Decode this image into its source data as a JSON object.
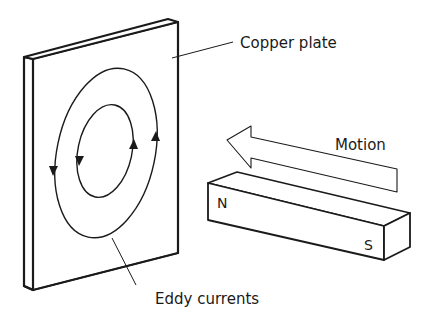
{
  "diagram": {
    "labels": {
      "copper_plate": "Copper plate",
      "eddy_currents": "Eddy currents",
      "motion": "Motion",
      "north": "N",
      "south": "S"
    },
    "colors": {
      "stroke": "#1a1a1a",
      "background": "#ffffff"
    }
  }
}
